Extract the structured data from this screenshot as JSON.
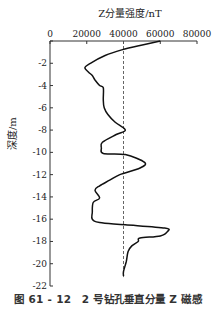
{
  "chart_data": {
    "type": "line",
    "title": "Z分量强度/nT",
    "xlabel": "Z分量强度/nT",
    "ylabel": "深度/m",
    "x_axis_position": "top",
    "xlim": [
      0,
      80000
    ],
    "ylim": [
      -22,
      0
    ],
    "x_ticks": [
      0,
      20000,
      40000,
      60000,
      80000
    ],
    "x_tick_labels": [
      "0",
      "20000",
      "40000",
      "60000",
      "80000"
    ],
    "y_ticks": [
      0,
      -2,
      -4,
      -6,
      -8,
      -10,
      -12,
      -14,
      -16,
      -18,
      -20,
      -22
    ],
    "y_tick_labels": [
      "",
      "-2",
      "-4",
      "-6",
      "-8",
      "-10",
      "-12",
      "-14",
      "-16",
      "-18",
      "-20",
      "-22"
    ],
    "grid": false,
    "reference_line": {
      "x": 40000,
      "style": "dashed"
    },
    "series": [
      {
        "name": "Z分量",
        "points": [
          [
            60000,
            0
          ],
          [
            49000,
            -0.4
          ],
          [
            39000,
            -0.8
          ],
          [
            30000,
            -1.3
          ],
          [
            22000,
            -2.0
          ],
          [
            19000,
            -2.4
          ],
          [
            21000,
            -2.8
          ],
          [
            23000,
            -3.1
          ],
          [
            24500,
            -3.5
          ],
          [
            27000,
            -4.0
          ],
          [
            29000,
            -4.2
          ],
          [
            29000,
            -5.3
          ],
          [
            29500,
            -6.0
          ],
          [
            31500,
            -6.6
          ],
          [
            35500,
            -7.3
          ],
          [
            41000,
            -8.0
          ],
          [
            36000,
            -8.4
          ],
          [
            28500,
            -9.1
          ],
          [
            28000,
            -9.6
          ],
          [
            29000,
            -10.1
          ],
          [
            41000,
            -10.2
          ],
          [
            51500,
            -10.9
          ],
          [
            49000,
            -11.4
          ],
          [
            38000,
            -12.0
          ],
          [
            32500,
            -12.5
          ],
          [
            27000,
            -13.0
          ],
          [
            24500,
            -13.4
          ],
          [
            27000,
            -14.1
          ],
          [
            23500,
            -14.5
          ],
          [
            23000,
            -15.4
          ],
          [
            23000,
            -16.0
          ],
          [
            27000,
            -16.3
          ],
          [
            41000,
            -16.5
          ],
          [
            62500,
            -16.8
          ],
          [
            64000,
            -17.1
          ],
          [
            60000,
            -17.5
          ],
          [
            49000,
            -17.7
          ],
          [
            48000,
            -18.0
          ],
          [
            44500,
            -18.4
          ],
          [
            42500,
            -18.9
          ],
          [
            41500,
            -19.8
          ],
          [
            40000,
            -20.7
          ],
          [
            40000,
            -21.1
          ]
        ]
      }
    ],
    "legend": null
  },
  "caption": "图 61 - 12　2 号钻孔垂直分量 Z 磁感",
  "colors": {
    "line": "#111111",
    "axis": "#333333",
    "dashed": "#555555"
  }
}
